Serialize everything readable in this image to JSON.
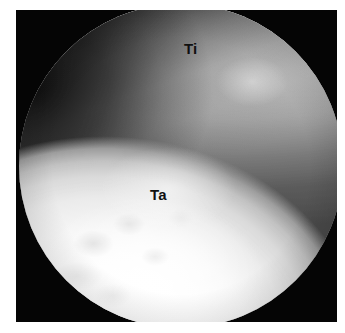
{
  "figure": {
    "kind": "arthroscopic-photograph",
    "modality": "ankle arthroscopy",
    "frame": {
      "background_color": "#ffffff",
      "border_color": "#050505"
    },
    "field_of_view": {
      "shape": "circle",
      "aperture_color": "#050505"
    },
    "labels": [
      {
        "id": "tibia",
        "text": "Ti",
        "meaning": "tibia",
        "color": "#101010"
      },
      {
        "id": "talus",
        "text": "Ta",
        "meaning": "talus",
        "color": "#101010"
      }
    ],
    "regions": [
      {
        "id": "tibial-plafond",
        "name": "tibial articular surface",
        "tone": "bright grey",
        "color": "#dedede"
      },
      {
        "id": "joint-space",
        "name": "tibiotalar joint space",
        "tone": "dark band",
        "color": "#2a2a2a"
      },
      {
        "id": "talar-dome",
        "name": "talar dome cartilage",
        "tone": "bright white",
        "color": "#fdfdfd"
      }
    ]
  }
}
